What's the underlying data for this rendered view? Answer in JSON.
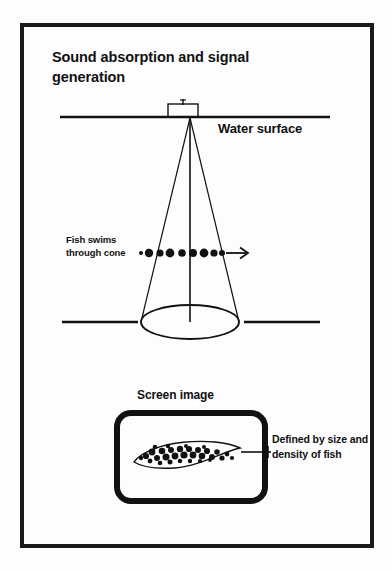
{
  "page": {
    "background_color": "#fdfdfd",
    "ink_color": "#111111",
    "frame": {
      "x": 22,
      "y": 25,
      "width": 350,
      "height": 521,
      "stroke": 4
    }
  },
  "diagram": {
    "title": "Sound absorption and signal generation",
    "labels": {
      "water_surface": "Water surface",
      "fish_swims": "Fish swims through cone",
      "screen_image": "Screen image",
      "defined_by": "Defined by size and density of fish"
    },
    "elements": {
      "transducer": {
        "name": "transducer-box",
        "x": 168,
        "y": 104,
        "width": 30,
        "height": 11
      },
      "water_surface_line": {
        "x1": 60,
        "y1": 117,
        "x2": 330,
        "y2": 117,
        "stroke": 2.6
      },
      "cone": {
        "apex_x": 190,
        "apex_y": 118,
        "base_cy": 322,
        "base_rx": 49,
        "base_ry": 17,
        "stroke": 1.2
      },
      "axis_line": {
        "x1": 190,
        "y1": 118,
        "x2": 190,
        "y2": 322,
        "stroke": 1.6
      },
      "seabed_left": {
        "x1": 62,
        "y1": 322,
        "x2": 138,
        "y2": 322,
        "stroke": 2.6
      },
      "seabed_right": {
        "x1": 244,
        "y1": 322,
        "x2": 320,
        "y2": 322,
        "stroke": 2.6
      },
      "fish_path": {
        "y": 253,
        "x_start": 139,
        "x_end": 248,
        "arrow_tip_x": 248
      },
      "screen_box": {
        "x": 117,
        "y": 413,
        "width": 148,
        "height": 88,
        "radius": 14,
        "stroke": 6
      },
      "fish_trace": {
        "cx": 190,
        "cy": 455,
        "width": 112,
        "height": 26
      },
      "leader_line": {
        "x1": 240,
        "y1": 452,
        "x2": 272,
        "y2": 452
      }
    },
    "fish_dots": [
      {
        "cx": 141,
        "cy": 253,
        "r": 2.0
      },
      {
        "cx": 149,
        "cy": 253,
        "r": 4.2
      },
      {
        "cx": 160,
        "cy": 253,
        "r": 3.6
      },
      {
        "cx": 170,
        "cy": 253,
        "r": 4.4
      },
      {
        "cx": 182,
        "cy": 253,
        "r": 3.8
      },
      {
        "cx": 193,
        "cy": 253,
        "r": 4.0
      },
      {
        "cx": 204,
        "cy": 253,
        "r": 4.4
      },
      {
        "cx": 214,
        "cy": 253,
        "r": 3.6
      },
      {
        "cx": 222,
        "cy": 253,
        "r": 3.0
      }
    ],
    "trace_speckles": [
      [
        146,
        456,
        3.1
      ],
      [
        152,
        452,
        3.4
      ],
      [
        157,
        458,
        3.0
      ],
      [
        162,
        451,
        3.3
      ],
      [
        166,
        457,
        3.5
      ],
      [
        171,
        450,
        3.0
      ],
      [
        175,
        456,
        3.4
      ],
      [
        180,
        449,
        3.2
      ],
      [
        184,
        455,
        3.6
      ],
      [
        189,
        449,
        3.1
      ],
      [
        193,
        455,
        3.4
      ],
      [
        198,
        450,
        3.0
      ],
      [
        202,
        456,
        3.3
      ],
      [
        207,
        451,
        3.1
      ],
      [
        212,
        457,
        3.0
      ],
      [
        217,
        452,
        2.8
      ],
      [
        222,
        458,
        2.6
      ],
      [
        227,
        454,
        2.4
      ],
      [
        232,
        458,
        2.1
      ],
      [
        150,
        461,
        2.4
      ],
      [
        160,
        463,
        2.3
      ],
      [
        170,
        462,
        2.5
      ],
      [
        180,
        461,
        2.3
      ],
      [
        190,
        461,
        2.2
      ],
      [
        200,
        461,
        2.1
      ],
      [
        210,
        460,
        1.9
      ],
      [
        141,
        458,
        2.2
      ],
      [
        155,
        447,
        2.3
      ],
      [
        168,
        446,
        2.2
      ],
      [
        186,
        446,
        2.0
      ],
      [
        204,
        447,
        2.0
      ]
    ]
  }
}
